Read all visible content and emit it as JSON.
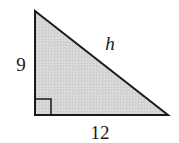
{
  "diagram": {
    "type": "right-triangle",
    "labels": {
      "vertical_leg": "9",
      "horizontal_leg": "12",
      "hypotenuse": "h"
    },
    "right_angle_marker": true,
    "colors": {
      "fill": "#d4d4d4",
      "stroke": "#1a1a1a"
    }
  }
}
